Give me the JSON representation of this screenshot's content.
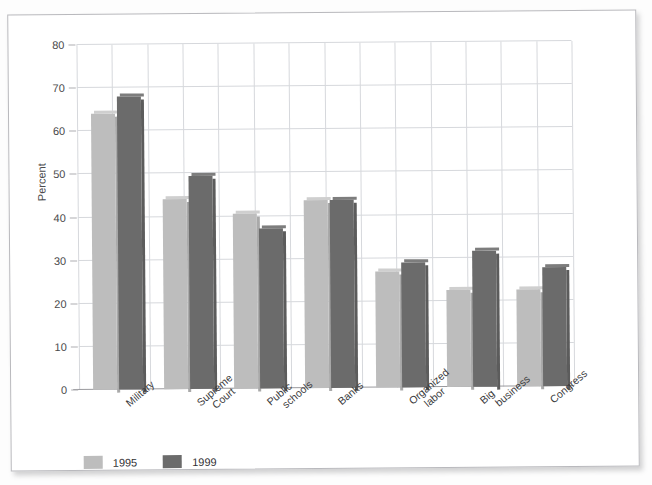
{
  "chart_data": {
    "type": "bar",
    "title": "",
    "xlabel": "",
    "ylabel": "Percent",
    "ylim": [
      0,
      80
    ],
    "yticks": [
      0,
      10,
      20,
      30,
      40,
      50,
      60,
      70,
      80
    ],
    "grid": true,
    "legend_position": "bottom-left",
    "categories": [
      "Military",
      "Supreme Court",
      "Public schools",
      "Banks",
      "Organized labor",
      "Big business",
      "Congress"
    ],
    "series": [
      {
        "name": "1995",
        "color": "#bdbdbd",
        "values": [
          64,
          44,
          40.5,
          43.5,
          27,
          22.5,
          22.5
        ]
      },
      {
        "name": "1999",
        "color": "#6b6b6b",
        "values": [
          68,
          49.5,
          37,
          43.5,
          29,
          31.5,
          27.5
        ]
      }
    ]
  },
  "axis": {
    "y_title": "Percent",
    "tick_labels": [
      "0",
      "10",
      "20",
      "30",
      "40",
      "50",
      "60",
      "70",
      "80"
    ]
  },
  "legend": {
    "items": [
      {
        "label": "1995"
      },
      {
        "label": "1999"
      }
    ]
  },
  "colors": {
    "series_1995": "#bdbdbd",
    "series_1999": "#6b6b6b",
    "grid": "#d6d8dc",
    "axis": "#9a9a9e",
    "text": "#39393b",
    "page": "#ffffff"
  }
}
